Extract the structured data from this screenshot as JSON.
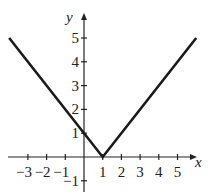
{
  "chart_data": {
    "type": "line",
    "title": "",
    "xlabel": "x",
    "ylabel": "y",
    "xlim": [
      -4,
      6
    ],
    "ylim": [
      -1,
      5
    ],
    "grid": false,
    "legend": null,
    "x_ticks": [
      -3,
      -2,
      -1,
      1,
      2,
      3,
      4,
      5
    ],
    "x_tick_labels": [
      "−3",
      "−2",
      "−1",
      "1",
      "2",
      "3",
      "4",
      "5"
    ],
    "y_ticks": [
      -1,
      1,
      2,
      3,
      4,
      5
    ],
    "y_tick_labels": [
      "−1",
      "1",
      "2",
      "3",
      "4",
      "5"
    ],
    "series": [
      {
        "name": "y = |x − 1|",
        "x": [
          -4,
          1,
          6
        ],
        "y": [
          5,
          0,
          5
        ],
        "color": "#1a1a1a"
      }
    ],
    "annotations": []
  },
  "labels": {
    "x_axis": "x",
    "y_axis": "y"
  }
}
